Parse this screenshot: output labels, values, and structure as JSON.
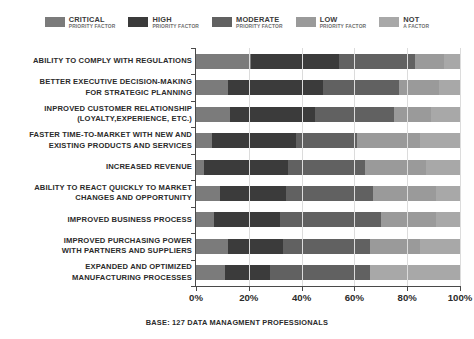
{
  "legend": {
    "entries": [
      {
        "name": "CRITICAL",
        "sub": "PRIORITY FACTOR",
        "color": "#7b7b7b",
        "swatch_icon": "legend-swatch-icon"
      },
      {
        "name": "HIGH",
        "sub": "PRIORITY FACTOR",
        "color": "#3b3b3b",
        "swatch_icon": "legend-swatch-icon"
      },
      {
        "name": "MODERATE",
        "sub": "PRIORITY FACTOR",
        "color": "#616161",
        "swatch_icon": "legend-swatch-icon"
      },
      {
        "name": "LOW",
        "sub": "PRIORITY FACTOR",
        "color": "#9a9a9a",
        "swatch_icon": "legend-swatch-icon"
      },
      {
        "name": "NOT",
        "sub": "A FACTOR",
        "color": "#a8a8a8",
        "swatch_icon": "legend-swatch-icon"
      }
    ]
  },
  "footer": {
    "text": "BASE: 127 DATA MANAGMENT PROFESSIONALS"
  },
  "chart_data": {
    "type": "bar",
    "orientation": "horizontal",
    "stacked": true,
    "title": "",
    "subtitle": "",
    "xlabel": "",
    "ylabel": "",
    "xlim": [
      0,
      100
    ],
    "xticks": [
      0,
      20,
      40,
      60,
      80,
      100
    ],
    "xtick_labels": [
      "0%",
      "20%",
      "40%",
      "60%",
      "80%",
      "100%"
    ],
    "grid": true,
    "grid_axis": "x",
    "legend_position": "top-center",
    "categories": [
      "ABILITY TO COMPLY WITH REGULATIONS",
      "BETTER EXECUTIVE DECISION-MAKING\nFOR STRATEGIC PLANNING",
      "INPROVED CUSTOMER RELATIONSHIP\n(LOYALTY,EXPERIENCE, ETC.)",
      "FASTER TIME-TO-MARKET WITH NEW AND\nEXISTING PRODUCTS AND SERVICES",
      "INCREASED REVENUE",
      "ABILITY TO REACT QUICKLY TO MARKET\nCHANGES AND OPPORTUNITY",
      "IMPROVED BUSINESS PROCESS",
      "IMPROVED PURCHASING POWER\nWITH PARTNERS AND SUPPLIERS",
      "EXPANDED AND OPTIMIZED\nMANUFACTURING PROCESSES"
    ],
    "series": [
      {
        "name": "CRITICAL PRIORITY FACTOR",
        "color": "#7b7b7b",
        "values": [
          21,
          12,
          13,
          6,
          3,
          9,
          7,
          12,
          11
        ]
      },
      {
        "name": "HIGH PRIORITY FACTOR",
        "color": "#3b3b3b",
        "values": [
          33,
          36,
          32,
          32,
          32,
          25,
          25,
          21,
          17
        ]
      },
      {
        "name": "MODERATE PRIORITY FACTOR",
        "color": "#616161",
        "values": [
          29,
          29,
          30,
          23,
          29,
          33,
          38,
          33,
          38
        ]
      },
      {
        "name": "LOW PRIORITY FACTOR",
        "color": "#9a9a9a",
        "values": [
          11,
          15,
          14,
          24,
          23,
          24,
          21,
          19,
          0
        ]
      },
      {
        "name": "NOT A FACTOR",
        "color": "#a8a8a8",
        "values": [
          6,
          8,
          11,
          15,
          13,
          9,
          9,
          15,
          34
        ]
      }
    ]
  }
}
